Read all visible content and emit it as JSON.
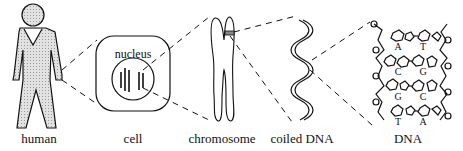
{
  "diagram": {
    "stages": [
      {
        "id": "human",
        "label": "human"
      },
      {
        "id": "cell",
        "label": "cell"
      },
      {
        "id": "chromosome",
        "label": "chromosome"
      },
      {
        "id": "coiled-dna",
        "label": "coiled DNA"
      },
      {
        "id": "dna",
        "label": "DNA"
      }
    ],
    "cell_inner_label": "nucleus",
    "base_pairs": [
      {
        "left": "A",
        "right": "T"
      },
      {
        "left": "C",
        "right": "G"
      },
      {
        "left": "G",
        "right": "C"
      },
      {
        "left": "T",
        "right": "A"
      }
    ],
    "colors": {
      "stroke": "#111111",
      "fill_human": "#d9d9d9",
      "background": "#ffffff"
    }
  }
}
